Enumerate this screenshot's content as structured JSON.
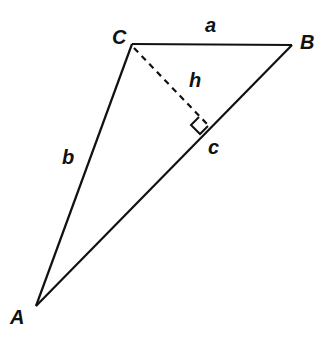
{
  "diagram": {
    "type": "triangle-with-altitude",
    "vertices": [
      {
        "label": "A",
        "x": 36,
        "y": 306
      },
      {
        "label": "B",
        "x": 292,
        "y": 45
      },
      {
        "label": "C",
        "x": 132,
        "y": 44
      }
    ],
    "sides": [
      {
        "label": "a",
        "from": "C",
        "to": "B"
      },
      {
        "label": "b",
        "from": "A",
        "to": "C"
      },
      {
        "label": "c",
        "from": "A",
        "to": "B"
      }
    ],
    "altitude": {
      "label": "h",
      "from": "C",
      "to_foot_on": "AB",
      "style": "dashed",
      "right_angle_marker": true
    },
    "colors": {
      "stroke": "#111111",
      "background": "#ffffff"
    }
  },
  "labels": {
    "A": "A",
    "B": "B",
    "C": "C",
    "a": "a",
    "b": "b",
    "c": "c",
    "h": "h"
  }
}
